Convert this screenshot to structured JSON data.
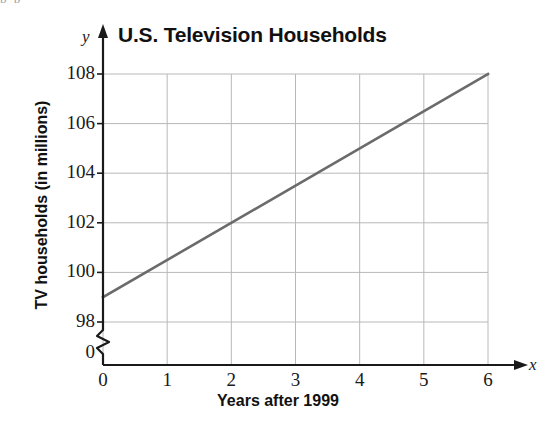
{
  "figure": {
    "top_cut_text": "p            p",
    "title": "U.S. Television Households",
    "y_axis_title": "TV households (in millions)",
    "x_axis_title": "Years after 1999",
    "y_axis_letter": "y",
    "x_axis_letter": "x",
    "axis_break_symbol": "axis-break-zigzag",
    "colors": {
      "line": "#6b6b6b",
      "axis": "#1a1a1a",
      "grid": "#b8b8b8",
      "text": "#111111",
      "background": "#ffffff"
    }
  },
  "chart_data": {
    "type": "line",
    "title": "U.S. Television Households",
    "xlabel": "Years after 1999",
    "ylabel": "TV households (in millions)",
    "x": [
      0,
      1,
      2,
      3,
      4,
      5,
      6
    ],
    "xtick_labels": [
      "0",
      "1",
      "2",
      "3",
      "4",
      "5",
      "6"
    ],
    "ytick_labels": [
      "0",
      "98",
      "100",
      "102",
      "104",
      "106",
      "108"
    ],
    "ytick_values": [
      0,
      98,
      100,
      102,
      104,
      106,
      108
    ],
    "xlim": [
      0,
      6
    ],
    "ylim": [
      98,
      108
    ],
    "y_axis_broken": true,
    "y_axis_break_below": 98,
    "grid": true,
    "legend": "none",
    "series": [
      {
        "name": "TV households",
        "x": [
          0,
          6
        ],
        "values": [
          99,
          108
        ],
        "endpoints": [
          {
            "x": 0,
            "y": 99
          },
          {
            "x": 6,
            "y": 108
          }
        ],
        "slope_per_year": 1.5,
        "intercept": 99,
        "color": "#6b6b6b",
        "style": "solid"
      }
    ]
  }
}
